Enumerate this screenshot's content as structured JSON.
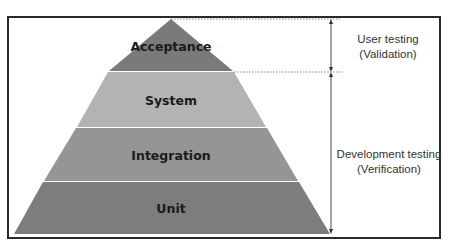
{
  "pyramid": {
    "tiers": [
      {
        "label": "Acceptance",
        "color": "#7a7a7a"
      },
      {
        "label": "System",
        "color": "#b3b3b3"
      },
      {
        "label": "Integration",
        "color": "#959595"
      },
      {
        "label": "Unit",
        "color": "#7d7d7d"
      }
    ]
  },
  "annotations": {
    "user_testing": {
      "line1": "User testing",
      "line2": "(Validation)"
    },
    "development_testing": {
      "line1": "Development testing",
      "line2": "(Verification)"
    }
  }
}
